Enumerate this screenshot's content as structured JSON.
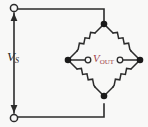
{
  "figure": {
    "background_color": "#f8f8f7",
    "wire_color": "#2b2b2b",
    "node_color": "#1a1a1a",
    "terminal_fill": "#f8f8f7"
  },
  "labels": {
    "source": {
      "symbol": "V",
      "subscript": "S",
      "full_text": "VS",
      "color": "#2b2b2b"
    },
    "output": {
      "symbol": "V",
      "subscript": "OUT",
      "full_text": "VOUT",
      "color": "#a1434a"
    }
  },
  "components": {
    "resistors": [
      {
        "name": "upper-left-resistor",
        "arm": "top-left"
      },
      {
        "name": "upper-right-resistor",
        "arm": "top-right"
      },
      {
        "name": "lower-left-resistor",
        "arm": "bottom-left"
      },
      {
        "name": "lower-right-resistor",
        "arm": "bottom-right"
      }
    ],
    "nodes": [
      {
        "name": "bridge-node-top"
      },
      {
        "name": "bridge-node-left"
      },
      {
        "name": "bridge-node-right"
      },
      {
        "name": "bridge-node-bottom"
      }
    ],
    "terminals": [
      {
        "name": "supply-terminal-top"
      },
      {
        "name": "supply-terminal-bottom"
      },
      {
        "name": "output-terminal-left"
      },
      {
        "name": "output-terminal-right"
      }
    ],
    "arrows": [
      {
        "name": "supply-arrow-up",
        "direction": "up"
      },
      {
        "name": "supply-arrow-down",
        "direction": "down"
      }
    ]
  }
}
